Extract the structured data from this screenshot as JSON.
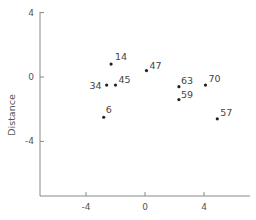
{
  "chart_data": {
    "type": "scatter",
    "title": "",
    "xlabel": "",
    "ylabel": "Distance",
    "xlim": [
      -8.2,
      7.0
    ],
    "ylim": [
      -7.4,
      4.0
    ],
    "grid": false,
    "legend": null,
    "x_ticks": [
      -4,
      0,
      4
    ],
    "y_ticks": [
      4,
      0,
      -4
    ],
    "x_tick_labels": [
      "-4",
      "0",
      "4"
    ],
    "y_tick_labels": [
      "4",
      "0",
      "-4"
    ],
    "points": [
      {
        "label": "14",
        "x": -2.3,
        "y": 0.8
      },
      {
        "label": "34",
        "x": -2.6,
        "y": -0.5
      },
      {
        "label": "45",
        "x": -2.0,
        "y": -0.5
      },
      {
        "label": "6",
        "x": -2.8,
        "y": -2.5
      },
      {
        "label": "47",
        "x": 0.1,
        "y": 0.4
      },
      {
        "label": "63",
        "x": 2.3,
        "y": -0.6
      },
      {
        "label": "59",
        "x": 2.3,
        "y": -1.4
      },
      {
        "label": "70",
        "x": 4.1,
        "y": -0.5
      },
      {
        "label": "57",
        "x": 4.9,
        "y": -2.6
      }
    ]
  },
  "label_offsets": {
    "14": [
      4,
      -4,
      "start"
    ],
    "34": [
      -5,
      4,
      "end"
    ],
    "45": [
      3,
      -2,
      "start"
    ],
    "6": [
      2,
      -4,
      "start"
    ],
    "47": [
      3,
      -2,
      "start"
    ],
    "63": [
      2,
      -3,
      "start"
    ],
    "59": [
      2,
      -2,
      "start"
    ],
    "70": [
      3,
      -3,
      "start"
    ],
    "57": [
      3,
      -3,
      "start"
    ]
  },
  "colors": {
    "axis": "#888888",
    "point": "#222222",
    "label": "#444444"
  }
}
